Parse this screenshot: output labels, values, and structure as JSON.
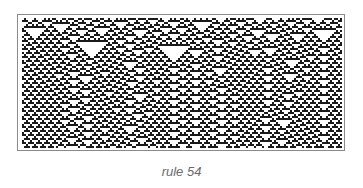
{
  "figure": {
    "caption": "rule 54",
    "automaton": {
      "rule": 54,
      "cell_size_px": 2,
      "columns": 160,
      "rows": 65,
      "initial_condition": "random",
      "on_color": "#1a1a1a",
      "off_color": "#ffffff"
    },
    "frame_color": "#8a8a8a"
  }
}
